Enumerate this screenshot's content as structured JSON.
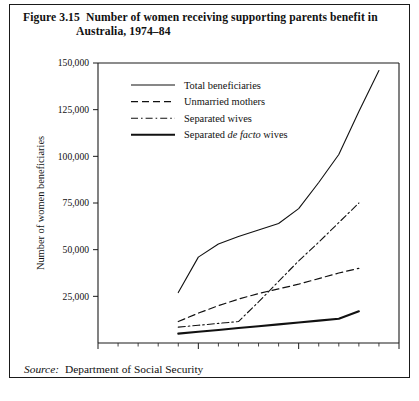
{
  "figure": {
    "number": "Figure 3.15",
    "title_line1": "Number of women receiving supporting parents benefit in",
    "title_line2": "Australia, 1974–84"
  },
  "source": {
    "label": "Source:",
    "text": "Department of Social Security"
  },
  "footer_note": "",
  "chart_data": {
    "type": "line",
    "title": "Number of women receiving supporting parents benefit in Australia, 1974–84",
    "xlabel": "Year",
    "ylabel": "Number of women beneficiaries",
    "xlim": [
      1970,
      1985
    ],
    "ylim": [
      0,
      150000
    ],
    "xticks": [
      1970,
      1975,
      1980,
      1985
    ],
    "xtick_labels": [
      "1970",
      "1975",
      "1980",
      "1985"
    ],
    "x_minor_tick_step": 1,
    "yticks": [
      25000,
      50000,
      75000,
      100000,
      125000,
      150000
    ],
    "ytick_labels": [
      "25,000",
      "50,000",
      "75,000",
      "100,000",
      "125,000",
      "150,000"
    ],
    "grid": false,
    "legend_position": "upper-left-inside",
    "series": [
      {
        "name": "Total beneficiaries",
        "style": "solid",
        "stroke_width": 1.1,
        "x": [
          1974,
          1975,
          1976,
          1977,
          1978,
          1979,
          1980,
          1981,
          1982,
          1983,
          1984
        ],
        "values": [
          27000,
          46000,
          53000,
          57000,
          60500,
          64000,
          72000,
          86000,
          101000,
          124000,
          146000
        ]
      },
      {
        "name": "Unmarried mothers",
        "style": "dashed",
        "stroke_width": 1.2,
        "x": [
          1974,
          1975,
          1976,
          1977,
          1978,
          1979,
          1980,
          1981,
          1982,
          1983
        ],
        "values": [
          11500,
          16000,
          20000,
          23500,
          26500,
          29000,
          31500,
          34500,
          37500,
          40000
        ]
      },
      {
        "name": "Separated wives",
        "style": "dash-dot",
        "stroke_width": 1.1,
        "x": [
          1974,
          1975,
          1976,
          1977,
          1978,
          1979,
          1980,
          1981,
          1982,
          1983
        ],
        "values": [
          8500,
          9500,
          10500,
          11500,
          22000,
          33000,
          44000,
          54000,
          64500,
          75000
        ]
      },
      {
        "name": "Separated de facto wives",
        "name_html": "Separated <i>de facto</i> wives",
        "style": "solid-thick",
        "stroke_width": 2.1,
        "x": [
          1974,
          1975,
          1976,
          1977,
          1978,
          1979,
          1980,
          1981,
          1982,
          1983
        ],
        "values": [
          5000,
          6000,
          7000,
          8000,
          9000,
          10000,
          11000,
          12000,
          13000,
          17000
        ]
      }
    ]
  }
}
